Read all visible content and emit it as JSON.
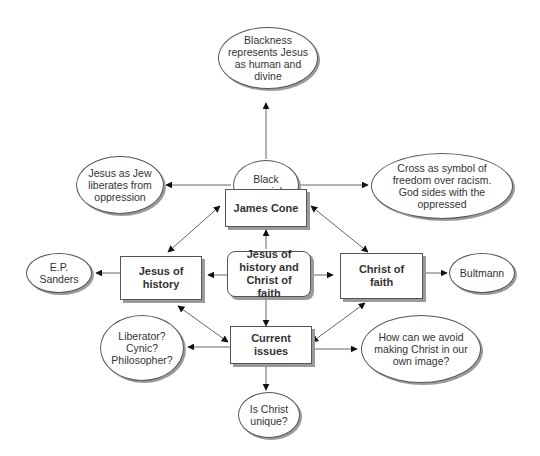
{
  "diagram": {
    "type": "concept-map",
    "center": {
      "label": "Jesus of history and Christ of faith"
    },
    "nodes": {
      "blackness": "Blackness represents Jesus as human and divine",
      "jew": "Jesus as Jew liberates from oppression",
      "black_messiah": "Black messiah",
      "cross": "Cross as symbol of freedom over racism. God sides with the oppressed",
      "james_cone": "James Cone",
      "ep_sanders": "E.P. Sanders",
      "jesus_history": "Jesus of history",
      "center": "Jesus of history and Christ of faith",
      "christ_faith": "Christ of faith",
      "bultmann": "Bultmann",
      "liberator": "Liberator? Cynic? Philosopher?",
      "current_issues": "Current issues",
      "avoid": "How can we avoid making Christ in our own image?",
      "unique": "Is Christ unique?"
    },
    "edges": [
      {
        "from": "black_messiah",
        "to": "blackness",
        "type": "arrow"
      },
      {
        "from": "black_messiah",
        "to": "jew",
        "type": "arrow"
      },
      {
        "from": "black_messiah",
        "to": "cross",
        "type": "arrow"
      },
      {
        "from": "james_cone",
        "to": "black_messiah",
        "type": "arrow"
      },
      {
        "from": "center",
        "to": "james_cone",
        "type": "arrow"
      },
      {
        "from": "center",
        "to": "jesus_history",
        "type": "arrow"
      },
      {
        "from": "center",
        "to": "christ_faith",
        "type": "arrow"
      },
      {
        "from": "center",
        "to": "current_issues",
        "type": "arrow"
      },
      {
        "from": "jesus_history",
        "to": "james_cone",
        "type": "double-arrow"
      },
      {
        "from": "james_cone",
        "to": "christ_faith",
        "type": "double-arrow"
      },
      {
        "from": "jesus_history",
        "to": "current_issues",
        "type": "double-arrow"
      },
      {
        "from": "christ_faith",
        "to": "current_issues",
        "type": "double-arrow"
      },
      {
        "from": "jesus_history",
        "to": "ep_sanders",
        "type": "arrow"
      },
      {
        "from": "christ_faith",
        "to": "bultmann",
        "type": "arrow"
      },
      {
        "from": "current_issues",
        "to": "liberator",
        "type": "arrow"
      },
      {
        "from": "current_issues",
        "to": "avoid",
        "type": "arrow"
      },
      {
        "from": "current_issues",
        "to": "unique",
        "type": "arrow"
      }
    ]
  }
}
